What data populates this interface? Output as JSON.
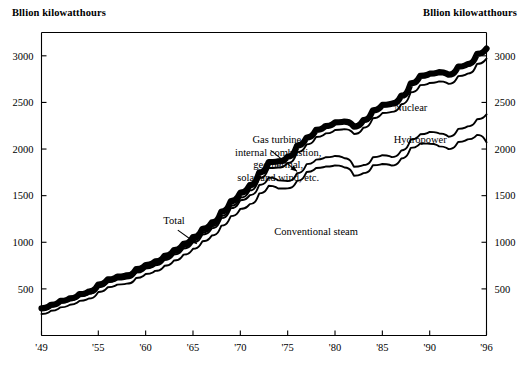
{
  "labels": {
    "unit_left": "Bllion kilowatthours",
    "unit_right": "Bllion kilowatthours"
  },
  "chart_data": {
    "type": "area",
    "title": "",
    "subtitle": "",
    "xlabel": "",
    "ylabel": "Bllion kilowatthours",
    "y2label": "Bllion kilowatthours",
    "grid": false,
    "legend_position": "inline-annotations",
    "xlim": [
      1949,
      1996
    ],
    "ylim": [
      0,
      3250
    ],
    "xticks": [
      1949,
      1955,
      1960,
      1965,
      1970,
      1975,
      1980,
      1985,
      1990,
      1996
    ],
    "xticklabels": [
      "'49",
      "'55",
      "'60",
      "'65",
      "'70",
      "'75",
      "'80",
      "'85",
      "'90",
      "'96"
    ],
    "yticks": [
      500,
      1000,
      1500,
      2000,
      2500,
      3000
    ],
    "yticklabels": [
      "500",
      "1000",
      "1500",
      "2000",
      "2500",
      "3000"
    ],
    "y2ticks": [
      500,
      1000,
      1500,
      2000,
      2500,
      3000
    ],
    "y2ticklabels": [
      "500",
      "1000",
      "1500",
      "2000",
      "2500",
      "3000"
    ],
    "x": [
      1949,
      1950,
      1951,
      1952,
      1953,
      1954,
      1955,
      1956,
      1957,
      1958,
      1959,
      1960,
      1961,
      1962,
      1963,
      1964,
      1965,
      1966,
      1967,
      1968,
      1969,
      1970,
      1971,
      1972,
      1973,
      1974,
      1975,
      1976,
      1977,
      1978,
      1979,
      1980,
      1981,
      1982,
      1983,
      1984,
      1985,
      1986,
      1987,
      1988,
      1989,
      1990,
      1991,
      1992,
      1993,
      1994,
      1995,
      1996
    ],
    "series": [
      {
        "name": "Total",
        "stack_label": "Gas turbine, internal combustion, geothermal, solar and wind, etc.",
        "line_style": "thick",
        "values": [
          291,
          329,
          371,
          399,
          443,
          472,
          547,
          601,
          632,
          645,
          711,
          756,
          794,
          855,
          917,
          984,
          1055,
          1144,
          1214,
          1329,
          1442,
          1532,
          1613,
          1750,
          1861,
          1867,
          1918,
          2038,
          2124,
          2206,
          2247,
          2286,
          2295,
          2241,
          2310,
          2416,
          2473,
          2487,
          2572,
          2704,
          2784,
          2808,
          2825,
          2797,
          2883,
          2911,
          3020,
          3077
        ]
      },
      {
        "name": "Nuclear",
        "line_style": "thin",
        "values": [
          280,
          317,
          358,
          385,
          428,
          456,
          529,
          581,
          611,
          623,
          687,
          731,
          767,
          826,
          886,
          951,
          1019,
          1105,
          1172,
          1283,
          1392,
          1479,
          1557,
          1689,
          1796,
          1802,
          1851,
          1967,
          2050,
          2129,
          2168,
          2205,
          2214,
          2162,
          2229,
          2331,
          2386,
          2399,
          2481,
          2609,
          2686,
          2709,
          2726,
          2699,
          2782,
          2809,
          2914,
          2969
        ]
      },
      {
        "name": "Hydropower",
        "line_style": "thin",
        "values": [
          275,
          311,
          351,
          378,
          420,
          447,
          519,
          570,
          599,
          611,
          674,
          717,
          752,
          810,
          869,
          933,
          999,
          1084,
          1150,
          1259,
          1366,
          1451,
          1504,
          1615,
          1694,
          1664,
          1656,
          1742,
          1838,
          1886,
          1912,
          1926,
          1901,
          1810,
          1828,
          1912,
          1934,
          1913,
          1985,
          2103,
          2158,
          2184,
          2167,
          2132,
          2216,
          2243,
          2320,
          2370
        ]
      },
      {
        "name": "Conventional steam",
        "line_style": "thin",
        "values": [
          230,
          265,
          302,
          330,
          371,
          397,
          467,
          518,
          546,
          556,
          617,
          659,
          693,
          748,
          805,
          867,
          930,
          1011,
          1073,
          1178,
          1280,
          1358,
          1409,
          1524,
          1607,
          1577,
          1578,
          1659,
          1754,
          1797,
          1812,
          1825,
          1802,
          1714,
          1742,
          1826,
          1840,
          1823,
          1899,
          2012,
          2060,
          2057,
          2029,
          1999,
          2076,
          2104,
          2152,
          2073
        ]
      }
    ],
    "annotations": [
      {
        "id": "gas-turbine",
        "text_lines": [
          "Gas turbine,",
          "internal combustion,",
          "geothermal,",
          "solar and wind, etc."
        ],
        "anchor_x": 1974,
        "anchor_y": 2060,
        "align": "center"
      },
      {
        "id": "total",
        "text_lines": [
          "Total"
        ],
        "anchor_x": 1963,
        "anchor_y": 1195,
        "align": "center"
      },
      {
        "id": "nuclear",
        "text_lines": [
          "Nuclear"
        ],
        "anchor_x": 1988,
        "anchor_y": 2410,
        "align": "center"
      },
      {
        "id": "hydropower",
        "text_lines": [
          "Hydropower"
        ],
        "anchor_x": 1989,
        "anchor_y": 2065,
        "align": "center"
      },
      {
        "id": "conventional-steam",
        "text_lines": [
          "Conventional steam"
        ],
        "anchor_x": 1978,
        "anchor_y": 1080,
        "align": "center"
      }
    ]
  }
}
